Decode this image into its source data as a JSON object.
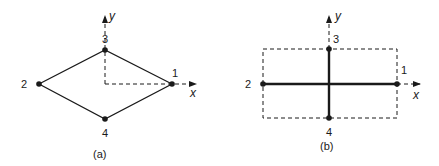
{
  "diagrams": [
    {
      "caption": "(a)",
      "axes": {
        "x_label": "x",
        "y_label": "y"
      },
      "nodes": [
        {
          "id": "1",
          "label": "1"
        },
        {
          "id": "2",
          "label": "2"
        },
        {
          "id": "3",
          "label": "3"
        },
        {
          "id": "4",
          "label": "4"
        }
      ]
    },
    {
      "caption": "(b)",
      "axes": {
        "x_label": "x",
        "y_label": "y"
      },
      "nodes": [
        {
          "id": "1",
          "label": "1"
        },
        {
          "id": "2",
          "label": "2"
        },
        {
          "id": "3",
          "label": "3"
        },
        {
          "id": "4",
          "label": "4"
        }
      ]
    }
  ],
  "colors": {
    "line": "#1a1a1a",
    "background": "#ffffff"
  }
}
